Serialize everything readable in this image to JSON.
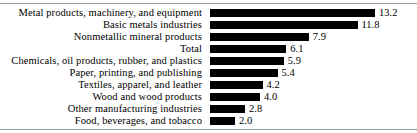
{
  "chart_data": {
    "type": "bar",
    "orientation": "horizontal",
    "title": "",
    "subtitle": "",
    "xlabel": "",
    "ylabel": "",
    "grid": false,
    "legend": null,
    "xlim": [
      0,
      13.2
    ],
    "value_format": "one-decimal",
    "categories": [
      "Metal products, machinery, and equipment",
      "Basic metals industries",
      "Nonmetallic mineral products",
      "Total",
      "Chemicals, oil products, rubber, and plastics",
      "Paper, printing, and publishing",
      "Textiles, apparel, and leather",
      "Wood and wood products",
      "Other manufacturing industries",
      "Food, beverages, and tobacco"
    ],
    "values": [
      13.2,
      11.8,
      7.9,
      6.1,
      5.9,
      5.4,
      4.2,
      4.0,
      2.8,
      2.0
    ],
    "value_labels": [
      "13.2",
      "11.8",
      "7.9",
      "6.1",
      "5.9",
      "5.4",
      "4.2",
      "4.0",
      "2.8",
      "2.0"
    ],
    "bar_color": "#000000",
    "background_color": "#ffffff",
    "rule_color": "#9a9a9a"
  }
}
